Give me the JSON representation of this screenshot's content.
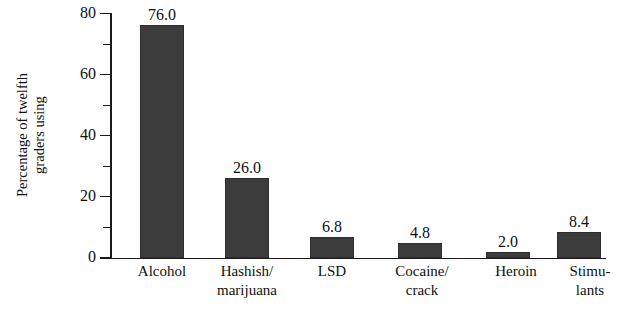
{
  "chart_data": {
    "type": "bar",
    "title": "",
    "xlabel": "",
    "ylabel": "Percentage of twelfth graders using",
    "ylabel_lines": [
      "Percentage of twelfth",
      "graders using"
    ],
    "categories": [
      "Alcohol",
      "Hashish/ marijuana",
      "LSD",
      "Cocaine/ crack",
      "Heroin",
      "Stimu- lants"
    ],
    "category_lines": [
      [
        "Alcohol"
      ],
      [
        "Hashish/",
        "marijuana"
      ],
      [
        "LSD"
      ],
      [
        "Cocaine/",
        "crack"
      ],
      [
        "Heroin"
      ],
      [
        "Stimu-",
        "lants"
      ]
    ],
    "values": [
      76.0,
      26.0,
      6.8,
      4.8,
      2.0,
      8.4
    ],
    "value_labels": [
      "76.0",
      "26.0",
      "6.8",
      "4.8",
      "2.0",
      "8.4"
    ],
    "ylim": [
      0,
      80
    ],
    "ytick_major": [
      0,
      20,
      40,
      60,
      80
    ],
    "ytick_major_labels": [
      "0",
      "20",
      "40",
      "60",
      "80"
    ],
    "ytick_minor": [
      10,
      30,
      50,
      70
    ],
    "grid": false,
    "legend": false,
    "bar_color": "#3c3c3c",
    "axis_color": "#1a1a1a"
  }
}
